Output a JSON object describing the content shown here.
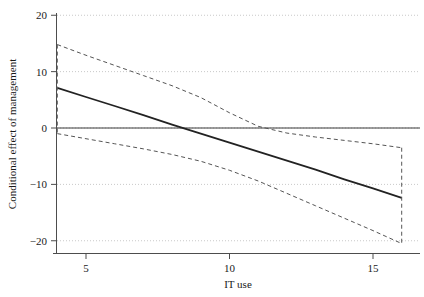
{
  "chart_data": {
    "type": "line",
    "title": "",
    "xlabel": "IT use",
    "ylabel": "Conditional effect of management",
    "xlim": [
      3.4,
      16.6
    ],
    "ylim": [
      -21.5,
      20.8
    ],
    "xticks": [
      5,
      10,
      15
    ],
    "xtick_labels": [
      "5",
      "10",
      "15"
    ],
    "yticks": [
      20,
      10,
      0,
      -10,
      -20
    ],
    "ytick_labels": [
      "20",
      "10",
      "0",
      "−10",
      "−20"
    ],
    "grid": "horizontal-dotted",
    "legend": "none",
    "zero_reference_line": 0,
    "x": [
      4,
      5,
      6,
      7,
      8,
      9,
      10,
      11,
      12,
      13,
      14,
      15,
      16
    ],
    "series": [
      {
        "name": "Conditional effect",
        "style": "solid",
        "color": "#222222",
        "values": [
          7.1,
          5.5,
          3.9,
          2.3,
          0.6,
          -1.0,
          -2.6,
          -4.2,
          -5.8,
          -7.4,
          -9.1,
          -10.7,
          -12.4
        ]
      },
      {
        "name": "Upper 95% confidence limit",
        "style": "dashed",
        "color": "#555555",
        "values": [
          14.8,
          12.9,
          11.1,
          9.3,
          7.5,
          5.4,
          2.7,
          0.3,
          -0.9,
          -1.6,
          -2.2,
          -2.8,
          -3.5
        ]
      },
      {
        "name": "Lower 95% confidence limit",
        "style": "dashed",
        "color": "#555555",
        "values": [
          -1.0,
          -1.9,
          -2.8,
          -3.7,
          -4.7,
          -5.9,
          -7.5,
          -9.4,
          -11.6,
          -13.8,
          -16.0,
          -18.2,
          -20.5
        ]
      }
    ],
    "endpoint_connectors": {
      "left_x": 4,
      "right_x": 16,
      "description": "vertical dashed segments joining the upper and lower confidence limits at the extreme x values"
    }
  },
  "axes": {
    "x_axis_name": "IT use",
    "y_axis_name": "Conditional effect of management"
  }
}
